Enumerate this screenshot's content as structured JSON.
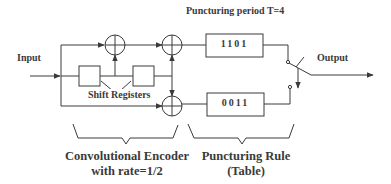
{
  "title": "Puncturing period T=4",
  "input_label": "Input",
  "output_label": "Output",
  "shift_registers_label": "Shift Registers",
  "puncture_tables": [
    {
      "pattern": "1101"
    },
    {
      "pattern": "0011"
    }
  ],
  "braces": {
    "encoder": {
      "line1": "Convolutional Encoder",
      "line2": "with rate=1/2"
    },
    "puncturing": {
      "line1": "Puncturing Rule",
      "line2": "(Table)"
    }
  },
  "colors": {
    "stroke": "#3a3a3a",
    "background": "#ffffff"
  }
}
